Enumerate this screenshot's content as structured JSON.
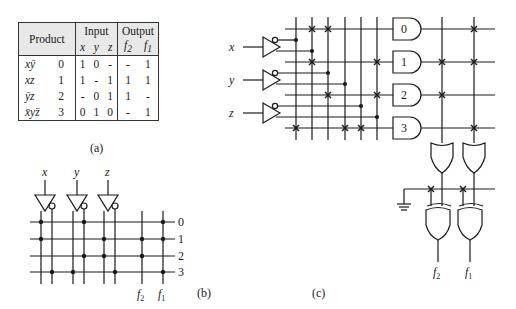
{
  "table": {
    "headers": {
      "product": "Product",
      "input": "Input",
      "output": "Output",
      "input_vars": [
        "x",
        "y",
        "z"
      ],
      "output_vars": [
        "f2",
        "f1"
      ]
    },
    "rows": [
      {
        "term": "xȳ",
        "index": "0",
        "x": "1",
        "y": "0",
        "z": "-",
        "f2": "-",
        "f1": "1"
      },
      {
        "term": "xz",
        "index": "1",
        "x": "1",
        "y": "-",
        "z": "1",
        "f2": "1",
        "f1": "1"
      },
      {
        "term": "ȳz",
        "index": "2",
        "x": "-",
        "y": "0",
        "z": "1",
        "f2": "1",
        "f1": "-"
      },
      {
        "term": "x̄yz̄",
        "index": "3",
        "x": "0",
        "y": "1",
        "z": "0",
        "f2": "-",
        "f1": "1"
      }
    ]
  },
  "captions": {
    "a": "(a)",
    "b": "(b)",
    "c": "(c)"
  },
  "panel_b": {
    "inputs": [
      "x",
      "y",
      "z"
    ],
    "rows": [
      "0",
      "1",
      "2",
      "3"
    ],
    "outputs": [
      "f2",
      "f1"
    ]
  },
  "panel_c": {
    "inputs": [
      "x",
      "y",
      "z"
    ],
    "and_gates": [
      "0",
      "1",
      "2",
      "3"
    ],
    "outputs": [
      "f2",
      "f1"
    ]
  }
}
